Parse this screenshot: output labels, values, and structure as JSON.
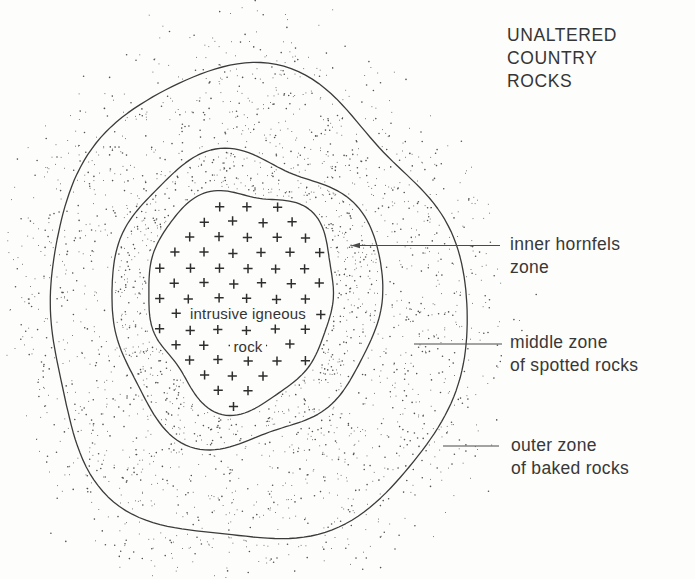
{
  "title_block": {
    "text": "UNALTERED\nCOUNTRY\nROCKS"
  },
  "labels": {
    "inner": {
      "text": "inner hornfels\nzone"
    },
    "middle": {
      "text": "middle zone\nof spotted rocks"
    },
    "outer": {
      "text": "outer zone\nof baked rocks"
    }
  },
  "center_label": {
    "line1": "intrusive igneous",
    "line2": "rock"
  },
  "colors": {
    "background": "#fdfdfb",
    "contour_line": "#3b3b3b",
    "leader_line": "#4a4a4a",
    "stipple": "#404040",
    "plus_symbol": "#2e2e2e",
    "text": "#343434"
  }
}
